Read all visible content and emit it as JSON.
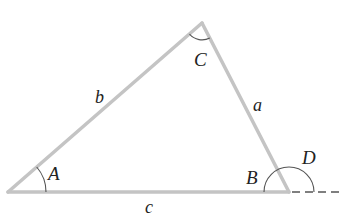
{
  "diagram": {
    "type": "triangle-exterior-angle",
    "vertices": {
      "A": {
        "label": "A",
        "x": 8,
        "y": 192
      },
      "B": {
        "label": "B",
        "x": 289,
        "y": 192
      },
      "C": {
        "label": "C",
        "x": 202,
        "y": 23
      }
    },
    "sides": {
      "a": {
        "label": "a",
        "from": "B",
        "to": "C"
      },
      "b": {
        "label": "b",
        "from": "A",
        "to": "C"
      },
      "c": {
        "label": "c",
        "from": "A",
        "to": "B"
      }
    },
    "exterior_angle": {
      "label": "D",
      "at": "B"
    },
    "colors": {
      "side_stroke": "#c4c4c4",
      "arc_stroke": "#555555",
      "dash_stroke": "#555555",
      "text": "#222222"
    }
  }
}
